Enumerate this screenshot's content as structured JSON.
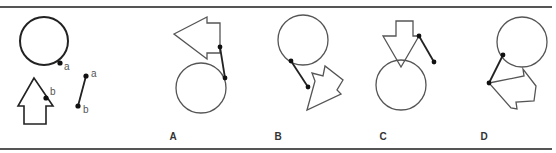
{
  "figure": {
    "type": "mental-rotation-puzzle",
    "rules": {
      "color": "#555555",
      "top_y": 7,
      "bottom_y": 149,
      "x1": 0,
      "x2": 552
    },
    "stroke": {
      "shape": "#555555",
      "dark": "#222222"
    },
    "reference": {
      "circle": {
        "cx": 44,
        "cy": 41,
        "r": 24
      },
      "circle_point": {
        "x": 60,
        "y": 63,
        "label": "a"
      },
      "arrow_points": "34,78 18,106 24,106 24,124 46,124 46,106 53,106",
      "arrow_point": {
        "x": 46,
        "y": 98,
        "label": "b"
      },
      "segment": {
        "x1": 86,
        "y1": 76,
        "x2": 78,
        "y2": 106,
        "label_a": "a",
        "label_b": "b"
      }
    },
    "options": [
      {
        "label": "A",
        "label_x": 173,
        "circle": {
          "cx": 201,
          "cy": 88,
          "r": 25
        },
        "arrow_points": "174,34 207,17 207,23 220,23 220,53 207,53 207,59",
        "segment": {
          "x1": 220,
          "y1": 47,
          "x2": 225,
          "y2": 78
        }
      },
      {
        "label": "B",
        "label_x": 278,
        "circle": {
          "cx": 303,
          "cy": 40,
          "r": 25
        },
        "arrow_points": "307,110 315,81 312,73 323,76 325,66 343,80 337,90 341,94",
        "segment": {
          "x1": 291,
          "y1": 61,
          "x2": 308,
          "y2": 87
        }
      },
      {
        "label": "C",
        "label_x": 383,
        "circle": {
          "cx": 401,
          "cy": 85,
          "r": 25
        },
        "arrow_points": "383,36 396,36 396,21 413,21 413,36 419,36 401,67",
        "segment": {
          "x1": 419,
          "y1": 36,
          "x2": 434,
          "y2": 62
        }
      },
      {
        "label": "D",
        "label_x": 484,
        "circle": {
          "cx": 522,
          "cy": 42,
          "r": 25
        },
        "arrow_points": "489,83 524,76 523,69 536,86 534,101 516,102 517,109 511,108",
        "segment": {
          "x1": 503,
          "y1": 55,
          "x2": 489,
          "y2": 83
        }
      }
    ],
    "label_y": 140
  }
}
